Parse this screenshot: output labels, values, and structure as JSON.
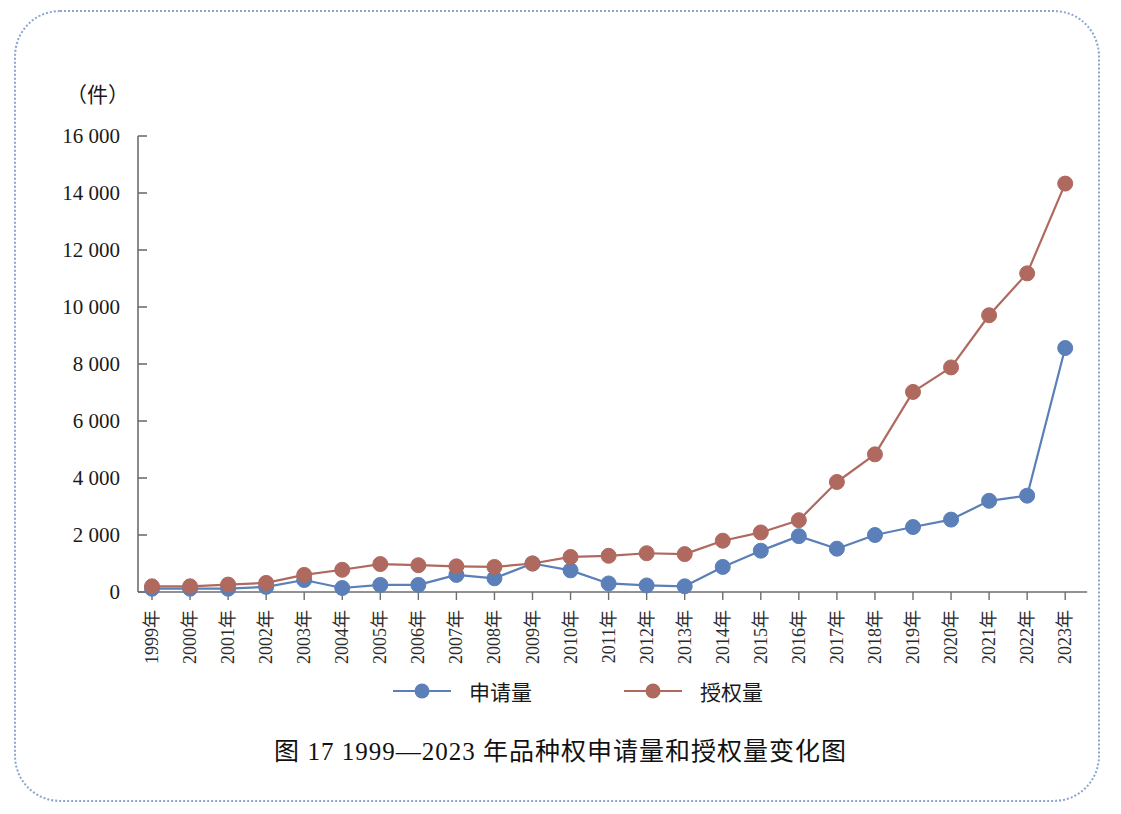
{
  "figure": {
    "caption": "图 17    1999—2023 年品种权申请量和授权量变化图",
    "unit_label": "（件）"
  },
  "colors": {
    "applications": "#5b7fb8",
    "grants": "#b0695f",
    "axis": "#6e6e6e",
    "text": "#1a1a1a",
    "frame": "#8aa6d0",
    "background": "#ffffff"
  },
  "chart_data": {
    "type": "line",
    "title": "图 17    1999—2023 年品种权申请量和授权量变化图",
    "xlabel": "",
    "ylabel": "（件）",
    "ylim": [
      0,
      16000
    ],
    "ytick_step": 2000,
    "ytick_labels": [
      "0",
      "2 000",
      "4 000",
      "6 000",
      "8 000",
      "10 000",
      "12 000",
      "14 000",
      "16 000"
    ],
    "grid": false,
    "legend_position": "bottom",
    "categories": [
      "1999年",
      "2000年",
      "2001年",
      "2002年",
      "2003年",
      "2004年",
      "2005年",
      "2006年",
      "2007年",
      "2008年",
      "2009年",
      "2010年",
      "2011年",
      "2012年",
      "2013年",
      "2014年",
      "2015年",
      "2016年",
      "2017年",
      "2018年",
      "2019年",
      "2020年",
      "2021年",
      "2022年",
      "2023年"
    ],
    "series": [
      {
        "name": "申请量",
        "color": "#5b7fb8",
        "values": [
          115,
          115,
          115,
          180,
          420,
          140,
          250,
          250,
          600,
          480,
          1000,
          760,
          300,
          230,
          200,
          880,
          1450,
          1960,
          1520,
          2000,
          2280,
          2540,
          3200,
          3380,
          8560
        ]
      },
      {
        "name": "授权量",
        "color": "#b0695f",
        "values": [
          200,
          200,
          260,
          320,
          600,
          780,
          980,
          940,
          900,
          880,
          1000,
          1230,
          1270,
          1360,
          1330,
          1800,
          2090,
          2520,
          3860,
          4830,
          7020,
          7880,
          9710,
          11180,
          14330
        ]
      }
    ]
  },
  "legend": {
    "items": [
      {
        "label": "申请量",
        "color": "#5b7fb8"
      },
      {
        "label": "授权量",
        "color": "#b0695f"
      }
    ]
  }
}
